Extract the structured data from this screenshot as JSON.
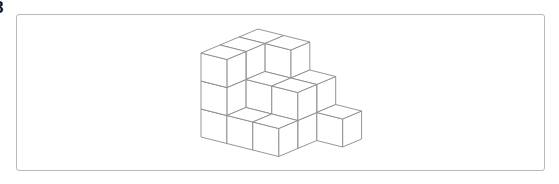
{
  "question": {
    "number": "8"
  },
  "figure": {
    "colors": {
      "edge": "#8a8a8a",
      "face": "#ffffff",
      "frame": "#b9b9b9"
    },
    "projection": {
      "origin": [
        201,
        137
      ],
      "x_axis": [
        25.9,
        6.5
      ],
      "y_axis": [
        19,
        -8
      ],
      "z_axis": [
        0,
        -28
      ]
    },
    "column_heights": [
      {
        "x": 0,
        "y": 0,
        "h": 3
      },
      {
        "x": 0,
        "y": 1,
        "h": 3
      },
      {
        "x": 0,
        "y": 2,
        "h": 3
      },
      {
        "x": 1,
        "y": 0,
        "h": 1
      },
      {
        "x": 1,
        "y": 1,
        "h": 2
      },
      {
        "x": 1,
        "y": 2,
        "h": 3
      },
      {
        "x": 2,
        "y": 0,
        "h": 1
      },
      {
        "x": 2,
        "y": 1,
        "h": 2
      },
      {
        "x": 2,
        "y": 2,
        "h": 2
      },
      {
        "x": 3,
        "y": 2,
        "h": 1
      }
    ]
  }
}
